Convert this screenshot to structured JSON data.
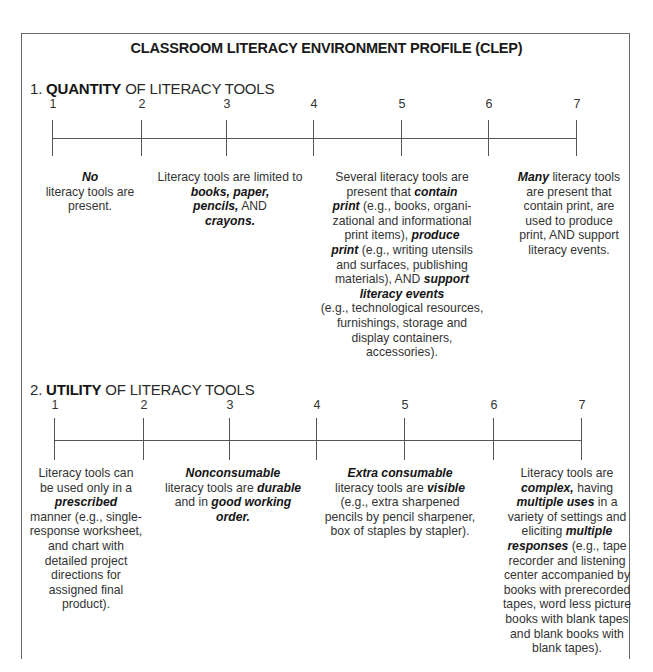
{
  "document": {
    "title": "CLASSROOM LITERACY ENVIRONMENT PROFILE (CLEP)"
  },
  "sections": [
    {
      "number": "1.",
      "keyword": "QUANTITY",
      "rest": " OF LITERACY TOOLS",
      "scale": [
        "1",
        "2",
        "3",
        "4",
        "5",
        "6",
        "7"
      ],
      "anchors": [
        {
          "points": "1-2",
          "segments": [
            {
              "t": "No",
              "s": "bi"
            },
            {
              "t": " literacy tools are present.",
              "s": ""
            }
          ]
        },
        {
          "points": "3",
          "segments": [
            {
              "t": "Literacy tools are limited to ",
              "s": ""
            },
            {
              "t": "books, paper, pencils,",
              "s": "bi"
            },
            {
              "t": " AND ",
              "s": ""
            },
            {
              "t": "crayons.",
              "s": "bi"
            }
          ]
        },
        {
          "points": "5",
          "segments": [
            {
              "t": "Several literacy tools are present that ",
              "s": ""
            },
            {
              "t": "contain print",
              "s": "bi"
            },
            {
              "t": " (e.g., books, organi-zational and informational print items), ",
              "s": ""
            },
            {
              "t": "produce print",
              "s": "bi"
            },
            {
              "t": " (e.g., writing utensils and surfaces, publishing materials), AND ",
              "s": ""
            },
            {
              "t": "support literacy events",
              "s": "bi"
            },
            {
              "t": " (e.g., technological resources, furnishings, storage and display containers, accessories).",
              "s": ""
            }
          ]
        },
        {
          "points": "7",
          "segments": [
            {
              "t": "Many",
              "s": "bi"
            },
            {
              "t": " literacy tools are present that contain print, are used to produce print, AND support literacy events.",
              "s": ""
            }
          ]
        }
      ]
    },
    {
      "number": "2.",
      "keyword": "UTILITY",
      "rest": " OF LITERACY TOOLS",
      "scale": [
        "1",
        "2",
        "3",
        "4",
        "5",
        "6",
        "7"
      ],
      "anchors": [
        {
          "points": "1",
          "segments": [
            {
              "t": "Literacy tools can be used only in a ",
              "s": ""
            },
            {
              "t": "prescribed",
              "s": "bi"
            },
            {
              "t": " manner (e.g., single-response worksheet, and chart with detailed project directions for assigned final product).",
              "s": ""
            }
          ]
        },
        {
          "points": "3",
          "segments": [
            {
              "t": "Nonconsumable",
              "s": "bi"
            },
            {
              "t": " literacy tools are ",
              "s": ""
            },
            {
              "t": "durable",
              "s": "bi"
            },
            {
              "t": " and in ",
              "s": ""
            },
            {
              "t": "good working order.",
              "s": "bi"
            }
          ]
        },
        {
          "points": "5",
          "segments": [
            {
              "t": "Extra consumable",
              "s": "bi"
            },
            {
              "t": " literacy tools are ",
              "s": ""
            },
            {
              "t": "visible",
              "s": "bi"
            },
            {
              "t": " (e.g., extra sharpened pencils by pencil sharpener, box of staples by stapler).",
              "s": ""
            }
          ]
        },
        {
          "points": "7",
          "segments": [
            {
              "t": "Literacy tools are ",
              "s": ""
            },
            {
              "t": "complex,",
              "s": "bi"
            },
            {
              "t": " having ",
              "s": ""
            },
            {
              "t": "multiple uses",
              "s": "bi"
            },
            {
              "t": " in a variety of settings and eliciting ",
              "s": ""
            },
            {
              "t": "multiple responses",
              "s": "bi"
            },
            {
              "t": " (e.g., tape recorder and listening center accompanied by books with prerecorded tapes, word less picture books with blank tapes and blank books with blank tapes).",
              "s": ""
            }
          ]
        }
      ]
    }
  ],
  "lines": {
    "s0_a0": [
      "No|bi",
      " literacy tools are",
      "present."
    ],
    "s0_a1": [
      "Literacy tools are limited to",
      "books, paper,|bi",
      "pencils,|bi| AND",
      "crayons.|bi"
    ],
    "s0_a2": [
      "Several literacy tools are",
      "present that |contain|bi",
      "print|bi| (e.g., books, organi-",
      "zational and informational",
      "print items), |produce|bi",
      "print|bi| (e.g., writing utensils",
      "and surfaces, publishing",
      "materials), AND |support|bi",
      "literacy events|bi",
      "(e.g., technological resources,",
      "furnishings, storage and",
      "display containers,",
      "accessories)."
    ],
    "s0_a3": [
      "Many|bi| literacy tools",
      "are present that",
      "contain print, are",
      "used to produce",
      "print, AND support",
      "literacy events."
    ],
    "s1_a0": [
      "Literacy tools can",
      "be used only in a",
      "prescribed|bi",
      "manner (e.g., single-",
      "response worksheet,",
      "and chart with",
      "detailed project",
      "directions for",
      "assigned final",
      "product)."
    ],
    "s1_a1": [
      "Nonconsumable|bi",
      "literacy tools are |durable|bi",
      "and in |good working|bi",
      "order.|bi"
    ],
    "s1_a2": [
      "Extra consumable|bi",
      "literacy tools are |visible|bi",
      "(e.g., extra sharpened",
      "pencils by pencil sharpener,",
      "box of staples by stapler)."
    ],
    "s1_a3": [
      "Literacy tools are",
      "complex,|bi| having",
      "multiple uses|bi| in a",
      "variety of settings and",
      "eliciting |multiple|bi",
      "responses|bi| (e.g., tape",
      "recorder and listening",
      "center accompanied by",
      "books with prerecorded",
      "tapes, word less picture",
      "books with blank tapes",
      "and blank books with",
      "blank tapes)."
    ]
  }
}
